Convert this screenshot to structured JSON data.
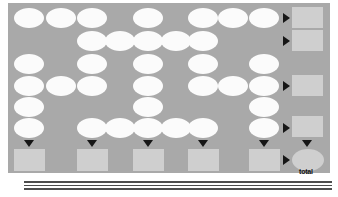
{
  "worksheet": {
    "title": "Addition grid puzzle",
    "total_label": "total",
    "panel_color": "#a9a9a9",
    "cell_color": "#fbfbfb",
    "sum_color": "#cfcfcf",
    "arrow_color": "#161616"
  },
  "grid": {
    "columns": 9,
    "rows": 6,
    "cell_value": "",
    "pattern": [
      [
        1,
        1,
        1,
        0,
        1,
        0,
        1,
        1,
        1
      ],
      [
        0,
        0,
        1,
        1,
        1,
        1,
        1,
        0,
        0
      ],
      [
        1,
        0,
        1,
        0,
        1,
        0,
        1,
        0,
        1
      ],
      [
        1,
        1,
        1,
        0,
        1,
        0,
        1,
        1,
        1
      ],
      [
        1,
        0,
        0,
        0,
        1,
        0,
        0,
        0,
        1
      ],
      [
        1,
        0,
        1,
        1,
        1,
        1,
        1,
        0,
        1
      ]
    ],
    "cells": [
      {
        "row": 0,
        "col": 0,
        "value": ""
      },
      {
        "row": 0,
        "col": 1,
        "value": ""
      },
      {
        "row": 0,
        "col": 2,
        "value": ""
      },
      {
        "row": 0,
        "col": 4,
        "value": ""
      },
      {
        "row": 0,
        "col": 6,
        "value": ""
      },
      {
        "row": 0,
        "col": 7,
        "value": ""
      },
      {
        "row": 0,
        "col": 8,
        "value": ""
      },
      {
        "row": 1,
        "col": 2,
        "value": ""
      },
      {
        "row": 1,
        "col": 3,
        "value": ""
      },
      {
        "row": 1,
        "col": 4,
        "value": ""
      },
      {
        "row": 1,
        "col": 5,
        "value": ""
      },
      {
        "row": 1,
        "col": 6,
        "value": ""
      },
      {
        "row": 2,
        "col": 0,
        "value": ""
      },
      {
        "row": 2,
        "col": 2,
        "value": ""
      },
      {
        "row": 2,
        "col": 4,
        "value": ""
      },
      {
        "row": 2,
        "col": 6,
        "value": ""
      },
      {
        "row": 2,
        "col": 8,
        "value": ""
      },
      {
        "row": 3,
        "col": 0,
        "value": ""
      },
      {
        "row": 3,
        "col": 1,
        "value": ""
      },
      {
        "row": 3,
        "col": 2,
        "value": ""
      },
      {
        "row": 3,
        "col": 4,
        "value": ""
      },
      {
        "row": 3,
        "col": 6,
        "value": ""
      },
      {
        "row": 3,
        "col": 7,
        "value": ""
      },
      {
        "row": 3,
        "col": 8,
        "value": ""
      },
      {
        "row": 4,
        "col": 0,
        "value": ""
      },
      {
        "row": 4,
        "col": 4,
        "value": ""
      },
      {
        "row": 4,
        "col": 8,
        "value": ""
      },
      {
        "row": 5,
        "col": 0,
        "value": ""
      },
      {
        "row": 5,
        "col": 2,
        "value": ""
      },
      {
        "row": 5,
        "col": 3,
        "value": ""
      },
      {
        "row": 5,
        "col": 4,
        "value": ""
      },
      {
        "row": 5,
        "col": 5,
        "value": ""
      },
      {
        "row": 5,
        "col": 6,
        "value": ""
      },
      {
        "row": 5,
        "col": 8,
        "value": ""
      }
    ]
  },
  "row_sums": [
    {
      "row": 0,
      "value": ""
    },
    {
      "row": 1,
      "value": ""
    },
    {
      "row": 3,
      "value": ""
    },
    {
      "row": 5,
      "value": ""
    }
  ],
  "column_sums": [
    {
      "col": 0,
      "value": ""
    },
    {
      "col": 2,
      "value": ""
    },
    {
      "col": 4,
      "value": ""
    },
    {
      "col": 6,
      "value": ""
    },
    {
      "col": 8,
      "value": ""
    }
  ],
  "total": {
    "value": "",
    "label": "total"
  }
}
